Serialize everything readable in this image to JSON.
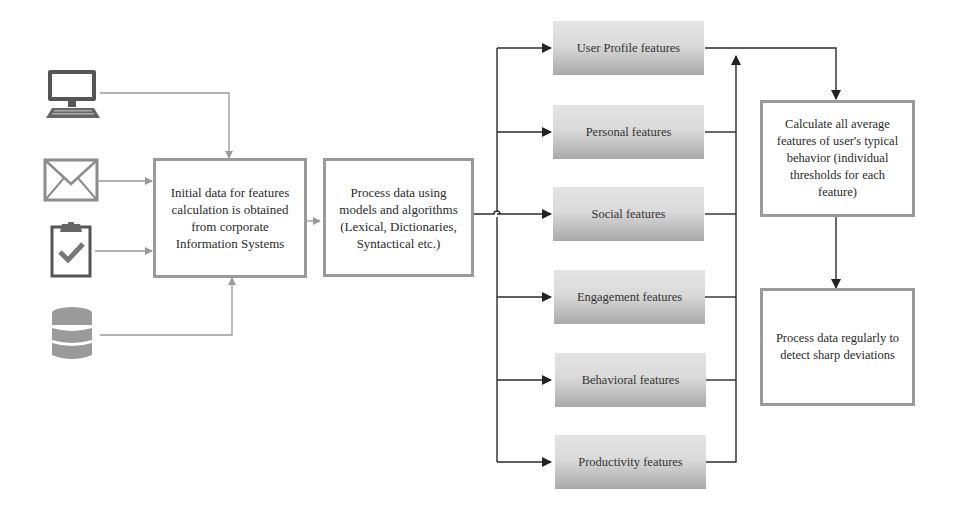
{
  "sources": [
    {
      "name": "computer",
      "icon": "computer-icon"
    },
    {
      "name": "email",
      "icon": "envelope-icon"
    },
    {
      "name": "tasks",
      "icon": "clipboard-check-icon"
    },
    {
      "name": "database",
      "icon": "database-icon"
    }
  ],
  "boxes": {
    "initial_data": "Initial data for features calculation is obtained from corporate Information Systems",
    "process_models": "Process data using models and algorithms (Lexical, Dictionaries, Syntactical etc.)",
    "calculate_average": "Calculate all average features of user's typical behavior (individual thresholds for each feature)",
    "detect_deviations": "Process data regularly to detect sharp deviations"
  },
  "features": [
    {
      "label": "User Profile features"
    },
    {
      "label": "Personal features"
    },
    {
      "label": "Social features"
    },
    {
      "label": "Engagement features"
    },
    {
      "label": "Behavioral features"
    },
    {
      "label": "Productivity features"
    }
  ],
  "colors": {
    "source_arrows": "#9a9a9a",
    "feature_arrows": "#2a2a2a",
    "box_border": "#9a9a9a"
  }
}
